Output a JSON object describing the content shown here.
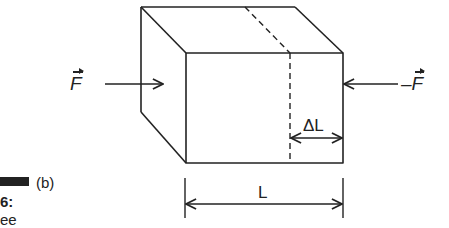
{
  "figure": {
    "part_label": "(b)",
    "caption_number_fragment": "6:",
    "caption_text_fragment": "ee"
  },
  "forces": {
    "left": {
      "symbol": "F",
      "sign": ""
    },
    "right": {
      "symbol": "F",
      "sign": "–"
    }
  },
  "dimensions": {
    "delta_length": "ΔL",
    "length": "L"
  },
  "colors": {
    "stroke": "#222222",
    "background": "#ffffff"
  }
}
